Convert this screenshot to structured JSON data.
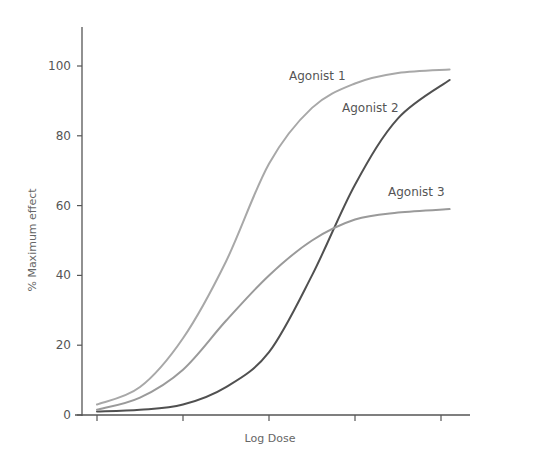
{
  "chart_data": {
    "type": "line",
    "title": "",
    "xlabel": "Log Dose",
    "ylabel": "% Maximum effect",
    "xlim": [
      0,
      4
    ],
    "ylim": [
      0,
      110
    ],
    "yticks": [
      0,
      20,
      40,
      60,
      80,
      100
    ],
    "xticks": [
      0,
      1,
      2,
      3,
      4
    ],
    "xtick_labels": [
      "",
      "",
      "",
      "",
      ""
    ],
    "grid": false,
    "legend": "inline labels next to curves",
    "series": [
      {
        "name": "Agonist 1",
        "color": "#a8a8a8",
        "width": 2,
        "x": [
          0,
          0.5,
          1,
          1.5,
          2,
          2.5,
          3,
          3.5,
          4.1
        ],
        "values": [
          3,
          8,
          22,
          44,
          72,
          88,
          95,
          98,
          99
        ],
        "label_pos": [
          289,
          80
        ]
      },
      {
        "name": "Agonist 2",
        "color": "#505050",
        "width": 2,
        "x": [
          0,
          0.5,
          1,
          1.5,
          2,
          2.5,
          3,
          3.5,
          4.1
        ],
        "values": [
          1,
          1.5,
          3,
          8,
          18,
          40,
          66,
          85,
          96
        ],
        "label_pos": [
          342,
          112
        ]
      },
      {
        "name": "Agonist 3",
        "color": "#9a9a9a",
        "width": 2,
        "x": [
          0,
          0.5,
          1,
          1.5,
          2,
          2.5,
          3,
          3.5,
          4.1
        ],
        "values": [
          1.5,
          5,
          13,
          27,
          40,
          50,
          56,
          58,
          59
        ],
        "label_pos": [
          388,
          196
        ]
      }
    ]
  }
}
